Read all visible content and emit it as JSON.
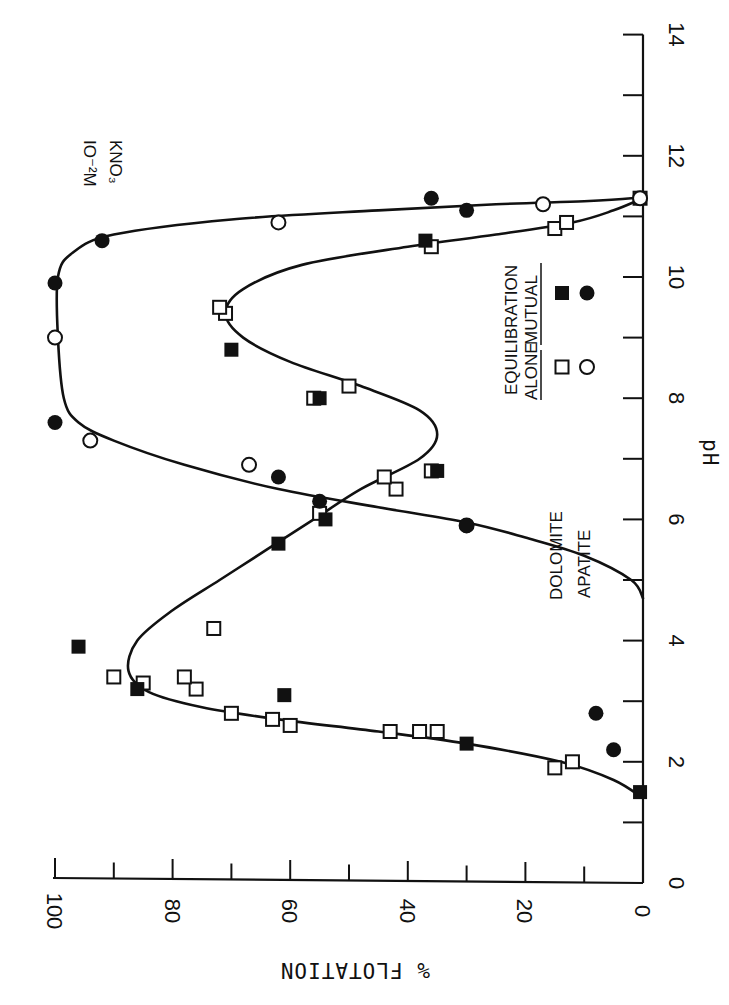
{
  "chart_data": {
    "type": "scatter",
    "orientation_note": "figure printed rotated 90 degrees clockwise",
    "title": "",
    "annotation": "10^-2 M KNO3",
    "annotation_lines": [
      "IO⁻²M",
      "KNO₃"
    ],
    "xlabel": "pH",
    "ylabel": "% FLOTATION",
    "xlim": [
      0,
      14
    ],
    "ylim": [
      0,
      100
    ],
    "x_ticks": [
      0,
      2,
      4,
      6,
      8,
      10,
      12,
      14
    ],
    "x_tick_labels": [
      "0",
      "2",
      "4",
      "6",
      "8",
      "10",
      "12",
      "14"
    ],
    "y_ticks": [
      0,
      20,
      40,
      60,
      80,
      100
    ],
    "y_tick_labels": [
      "0",
      "20",
      "40",
      "60",
      "80",
      "100"
    ],
    "grid": false,
    "legend": {
      "header": "EQUILIBRATION",
      "columns": [
        "ALONE",
        "MUTUAL"
      ],
      "rows": [
        {
          "mineral": "DOLOMITE",
          "alone_marker": "open-square",
          "mutual_marker": "filled-square"
        },
        {
          "mineral": "APATITE",
          "alone_marker": "open-circle",
          "mutual_marker": "filled-circle"
        }
      ]
    },
    "series": [
      {
        "name": "Dolomite - Alone",
        "marker": "open-square",
        "points": [
          [
            1.9,
            15
          ],
          [
            2.0,
            12
          ],
          [
            2.5,
            43
          ],
          [
            2.5,
            38
          ],
          [
            2.5,
            35
          ],
          [
            2.6,
            60
          ],
          [
            2.7,
            63
          ],
          [
            2.8,
            70
          ],
          [
            3.2,
            76
          ],
          [
            3.3,
            85
          ],
          [
            3.4,
            78
          ],
          [
            3.4,
            90
          ],
          [
            4.2,
            73
          ],
          [
            6.1,
            55
          ],
          [
            6.5,
            42
          ],
          [
            6.7,
            44
          ],
          [
            6.8,
            36
          ],
          [
            8.0,
            56
          ],
          [
            8.2,
            50
          ],
          [
            9.4,
            71
          ],
          [
            9.5,
            72
          ],
          [
            10.5,
            36
          ],
          [
            10.8,
            15
          ],
          [
            10.9,
            13
          ],
          [
            11.3,
            0.5
          ]
        ]
      },
      {
        "name": "Dolomite - Mutual",
        "marker": "filled-square",
        "points": [
          [
            1.5,
            0.5
          ],
          [
            2.3,
            30
          ],
          [
            3.1,
            61
          ],
          [
            3.2,
            86
          ],
          [
            3.9,
            96
          ],
          [
            5.6,
            62
          ],
          [
            6.0,
            54
          ],
          [
            6.8,
            35
          ],
          [
            8.0,
            55
          ],
          [
            8.8,
            70
          ],
          [
            10.6,
            37
          ]
        ]
      },
      {
        "name": "Apatite - Alone",
        "marker": "open-circle",
        "points": [
          [
            5.9,
            30
          ],
          [
            6.9,
            67
          ],
          [
            7.3,
            94
          ],
          [
            9.0,
            100
          ],
          [
            10.9,
            62
          ],
          [
            11.2,
            17
          ],
          [
            11.3,
            0.5
          ]
        ]
      },
      {
        "name": "Apatite - Mutual",
        "marker": "filled-circle",
        "points": [
          [
            2.2,
            5
          ],
          [
            2.8,
            8
          ],
          [
            5.9,
            30
          ],
          [
            6.3,
            55
          ],
          [
            6.7,
            62
          ],
          [
            7.6,
            100
          ],
          [
            9.9,
            100
          ],
          [
            10.6,
            92
          ],
          [
            11.1,
            30
          ],
          [
            11.3,
            36
          ]
        ]
      }
    ],
    "fitted_curves": [
      {
        "name": "Dolomite fit",
        "points": [
          [
            1.4,
            0
          ],
          [
            1.7,
            5
          ],
          [
            2.0,
            14
          ],
          [
            2.3,
            30
          ],
          [
            2.5,
            45
          ],
          [
            2.7,
            62
          ],
          [
            2.9,
            75
          ],
          [
            3.15,
            84
          ],
          [
            3.5,
            87.5
          ],
          [
            4.0,
            86
          ],
          [
            4.5,
            80
          ],
          [
            5.0,
            72
          ],
          [
            5.5,
            64
          ],
          [
            6.0,
            56
          ],
          [
            6.5,
            48
          ],
          [
            7.0,
            38
          ],
          [
            7.4,
            35
          ],
          [
            7.8,
            38
          ],
          [
            8.2,
            48
          ],
          [
            8.6,
            60
          ],
          [
            9.0,
            68
          ],
          [
            9.4,
            71
          ],
          [
            9.8,
            68
          ],
          [
            10.2,
            58
          ],
          [
            10.5,
            40
          ],
          [
            10.7,
            25
          ],
          [
            10.9,
            12
          ],
          [
            11.1,
            5
          ],
          [
            11.3,
            0
          ]
        ]
      },
      {
        "name": "Apatite fit",
        "points": [
          [
            4.7,
            0
          ],
          [
            5.0,
            2
          ],
          [
            5.4,
            10
          ],
          [
            5.7,
            20
          ],
          [
            5.95,
            30
          ],
          [
            6.2,
            45
          ],
          [
            6.5,
            62
          ],
          [
            6.9,
            78
          ],
          [
            7.3,
            90
          ],
          [
            7.6,
            96
          ],
          [
            8.0,
            98.5
          ],
          [
            9.0,
            99.5
          ],
          [
            10.0,
            99.5
          ],
          [
            10.4,
            97
          ],
          [
            10.7,
            90
          ],
          [
            10.95,
            70
          ],
          [
            11.1,
            45
          ],
          [
            11.2,
            25
          ],
          [
            11.25,
            10
          ],
          [
            11.3,
            2
          ],
          [
            11.35,
            0
          ]
        ]
      }
    ]
  },
  "layout": {
    "origin_px": [
      643,
      883
    ],
    "px_per_pH": 60.6,
    "px_per_percent": 5.88,
    "ink_color": "#111111",
    "paper_color": "#ffffff"
  }
}
